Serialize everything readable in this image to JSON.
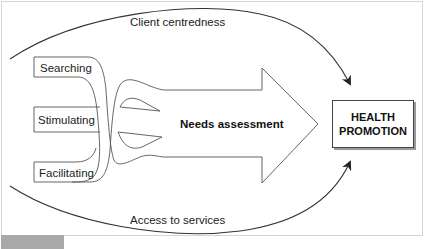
{
  "diagram": {
    "top_arc_label": "Client centredness",
    "bottom_arc_label": "Access to services",
    "inputs": [
      {
        "label": "Searching"
      },
      {
        "label": "Stimulating"
      },
      {
        "label": "Facilitating"
      }
    ],
    "main_arrow_label": "Needs assessment",
    "target": {
      "line1": "HEALTH",
      "line2": "PROMOTION"
    },
    "colors": {
      "stroke": "#444444",
      "arc": "#333333",
      "frame": "#d4d4d4",
      "footer_tab": "#a8a8a8"
    }
  }
}
